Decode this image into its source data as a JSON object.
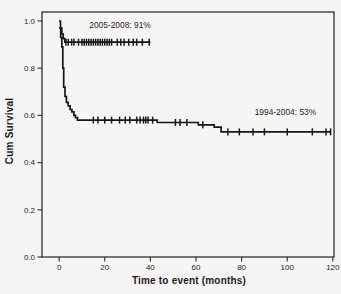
{
  "chart_data": {
    "type": "line",
    "subtype": "kaplan-meier-step",
    "title": "",
    "xlabel": "Time to event (months)",
    "ylabel": "Cum Survival",
    "xlim": [
      -7.5,
      120.5
    ],
    "ylim": [
      0,
      1.038
    ],
    "grid": false,
    "legend_position": "inline-annotations",
    "line_color": "#161616",
    "frame_color": "#2e2e2e",
    "text_color": "#262626",
    "background_color": "#f6f5f3",
    "x_ticks": [
      0,
      20,
      40,
      60,
      80,
      100,
      120
    ],
    "y_ticks": [
      {
        "value": 0.0,
        "label": "0.0"
      },
      {
        "value": 0.2,
        "label": "0.2"
      },
      {
        "value": 0.4,
        "label": "0.4"
      },
      {
        "value": 0.6,
        "label": "0.6"
      },
      {
        "value": 0.8,
        "label": "0.8"
      },
      {
        "value": 1.0,
        "label": "1.0"
      }
    ],
    "series": [
      {
        "name": "2005-2008",
        "label": "2005-2008: 91%",
        "final_survival": 0.91,
        "label_x": 26.7,
        "label_y": 0.985,
        "steps": [
          [
            0,
            1.0
          ],
          [
            0.6,
            0.97
          ],
          [
            1.2,
            0.945
          ],
          [
            1.8,
            0.925
          ],
          [
            2.5,
            0.91
          ],
          [
            40,
            0.91
          ]
        ],
        "censor_times": [
          3,
          4,
          5.5,
          6.5,
          8.5,
          10,
          11,
          12,
          13,
          14,
          15,
          16,
          17,
          18,
          19,
          20,
          21,
          22,
          23,
          25.5,
          27,
          28.5,
          30.5,
          32.5,
          34,
          36.5,
          39.5
        ]
      },
      {
        "name": "1994-2004",
        "label": "1994-2004: 53%",
        "final_survival": 0.53,
        "label_x": 99.2,
        "label_y": 0.614,
        "steps": [
          [
            0,
            0.97
          ],
          [
            0.7,
            0.93
          ],
          [
            1.2,
            0.89
          ],
          [
            1.6,
            0.8
          ],
          [
            2,
            0.72
          ],
          [
            2.6,
            0.68
          ],
          [
            3.2,
            0.655
          ],
          [
            4,
            0.64
          ],
          [
            4.8,
            0.625
          ],
          [
            5.6,
            0.615
          ],
          [
            6.5,
            0.6
          ],
          [
            7.2,
            0.59
          ],
          [
            8,
            0.58
          ],
          [
            43,
            0.57
          ],
          [
            61,
            0.56
          ],
          [
            68,
            0.55
          ],
          [
            71,
            0.53
          ],
          [
            119,
            0.53
          ]
        ],
        "censor_times": [
          15,
          17,
          20,
          23,
          26.5,
          29,
          31,
          34,
          35.5,
          37,
          38,
          39,
          41,
          51,
          53,
          56,
          63,
          74,
          79,
          85,
          90,
          100,
          111,
          117,
          119
        ]
      }
    ]
  }
}
